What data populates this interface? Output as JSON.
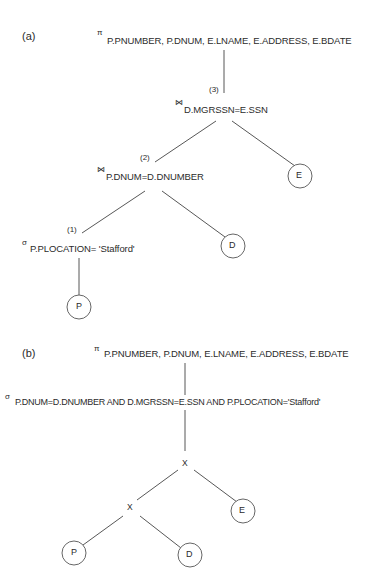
{
  "figure": {
    "part_a": {
      "label": "(a)",
      "projection": {
        "symbol": "π",
        "attributes": "P.PNUMBER, P.DNUM, E.LNAME, E.ADDRESS, E.BDATE"
      },
      "join_3": {
        "step": "(3)",
        "symbol": "⋈",
        "condition": "D.MGRSSN=E.SSN"
      },
      "join_2": {
        "step": "(2)",
        "symbol": "⋈",
        "condition": "P.DNUM=D.DNUMBER"
      },
      "select_1": {
        "step": "(1)",
        "symbol": "σ",
        "condition": "P.PLOCATION= 'Stafford'"
      },
      "relations": {
        "p": "P",
        "d": "D",
        "e": "E"
      }
    },
    "part_b": {
      "label": "(b)",
      "projection": {
        "symbol": "π",
        "attributes": "P.PNUMBER, P.DNUM, E.LNAME, E.ADDRESS, E.BDATE"
      },
      "selection": {
        "symbol": "σ",
        "condition": "P.DNUM=D.DNUMBER AND D.MGRSSN=E.SSN AND P.PLOCATION='Stafford'"
      },
      "cross_top": "X",
      "cross_bottom": "X",
      "relations": {
        "p": "P",
        "d": "D",
        "e": "E"
      }
    }
  }
}
